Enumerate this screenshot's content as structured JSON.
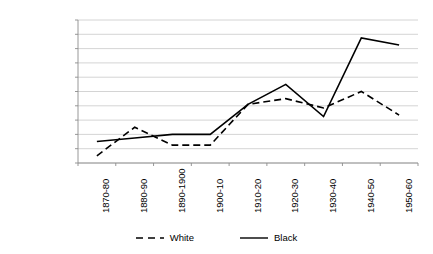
{
  "chart_data": {
    "type": "line",
    "title": "",
    "subtitle": "",
    "xlabel": "",
    "ylabel": "",
    "grid": true,
    "legend_position": "bottom",
    "categories": [
      "1870-80",
      "1880-90",
      "1890-1900",
      "1900-10",
      "1910-20",
      "1920-30",
      "1930-40",
      "1940-50",
      "1950-60"
    ],
    "ylim": [
      -200000,
      1800000
    ],
    "ytick_step": 200000,
    "ytick_labels": [
      "1,800,000",
      "1,600,000",
      "1,400,000",
      "1,200,000",
      "1,000,000",
      "800,000",
      "600,000",
      "400,000",
      "200,000",
      "0",
      "-200,000"
    ],
    "ytick_values": [
      1800000,
      1600000,
      1400000,
      1200000,
      1000000,
      800000,
      600000,
      400000,
      200000,
      0,
      -200000
    ],
    "series": [
      {
        "name": "White",
        "style": "dashed",
        "color": "#000000",
        "values": [
          -100000,
          300000,
          50000,
          50000,
          620000,
          700000,
          570000,
          800000,
          470000
        ]
      },
      {
        "name": "Black",
        "style": "solid",
        "color": "#000000",
        "values": [
          100000,
          150000,
          200000,
          200000,
          620000,
          900000,
          450000,
          1550000,
          1450000
        ]
      }
    ]
  },
  "legend": {
    "items": [
      {
        "label": "White",
        "style": "dashed"
      },
      {
        "label": "Black",
        "style": "solid"
      }
    ]
  }
}
